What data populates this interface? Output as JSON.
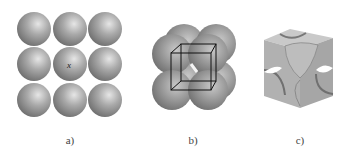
{
  "figure": {
    "panels": [
      {
        "id": "a",
        "label": "a)",
        "description": "Square array of 9 spheres (top view of simple cubic layer)",
        "center_marker": "x"
      },
      {
        "id": "b",
        "label": "b)",
        "description": "8 spheres in simple cubic packing with unit cell outlined"
      },
      {
        "id": "c",
        "label": "c)",
        "description": "Unit cell cube with sphere sections at corners"
      }
    ]
  }
}
